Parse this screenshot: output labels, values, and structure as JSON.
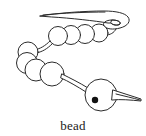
{
  "figure": {
    "caption": "bead",
    "style": "line-drawing",
    "colors": {
      "background": "#ffffff",
      "stroke": "#2b2b2b",
      "hole_fill": "#111111"
    },
    "parts": {
      "needle_label": "needle",
      "thread_label": "thread",
      "small_beads_label": "small beads",
      "large_bead_label": "large bead",
      "bead_hole_label": "bead hole",
      "needle_eye_label": "needle eye"
    },
    "counts": {
      "small_beads": 8,
      "large_beads": 1,
      "total_beads": 9
    }
  }
}
